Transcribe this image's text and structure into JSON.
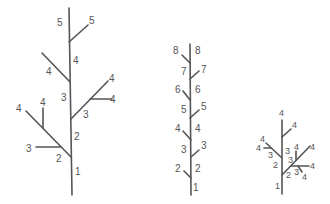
{
  "diagram": {
    "trees": [
      {
        "name": "tree-1",
        "labels": {
          "trunk_1": "1",
          "trunk_2": "2",
          "trunk_3": "3",
          "trunk_4": "4",
          "trunk_5": "5",
          "left_low_2": "2",
          "left_low_3": "3",
          "left_low_4a": "4",
          "left_low_4b": "4",
          "right_mid_3": "3",
          "right_mid_4a": "4",
          "right_mid_4b": "4",
          "left_high_4": "4",
          "right_top_5": "5"
        }
      },
      {
        "name": "tree-2",
        "labels": {
          "trunk_1": "1",
          "left_2": "2",
          "right_2": "2",
          "left_3": "3",
          "right_3": "3",
          "left_4": "4",
          "right_4": "4",
          "left_5": "5",
          "right_5": "5",
          "left_6": "6",
          "right_6": "6",
          "left_7": "7",
          "right_7": "7",
          "left_8": "8",
          "right_8": "8"
        }
      },
      {
        "name": "tree-3",
        "labels": {
          "trunk_1": "1",
          "trunk_2": "2",
          "trunk_3": "3",
          "trunk_4": "4",
          "top_right_4": "4",
          "left_3": "3",
          "left_4a": "4",
          "left_4b": "4",
          "right_2": "2",
          "right_3a": "3",
          "right_3b": "3",
          "right_4a": "4",
          "right_4b": "4",
          "right_4c": "4",
          "right_4d": "4"
        }
      }
    ]
  }
}
